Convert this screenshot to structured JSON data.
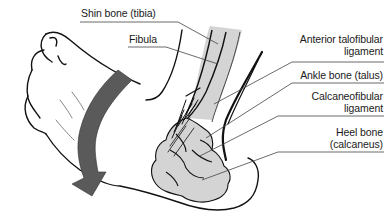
{
  "diagram": {
    "colors": {
      "bone_fill": "#d4d4d4",
      "outline": "#111111",
      "arrow_fill": "#5a5a5a",
      "leader_line": "#444444",
      "background": "#ffffff"
    },
    "labels": [
      {
        "id": "tibia",
        "lines": [
          "Shin bone (tibia)"
        ],
        "align": "left"
      },
      {
        "id": "fibula",
        "lines": [
          "Fibula"
        ],
        "align": "left"
      },
      {
        "id": "atfl",
        "lines": [
          "Anterior talofibular",
          "ligament"
        ],
        "align": "right"
      },
      {
        "id": "talus",
        "lines": [
          "Ankle bone (talus)"
        ],
        "align": "right"
      },
      {
        "id": "cfl",
        "lines": [
          "Calcaneofibular",
          "ligament"
        ],
        "align": "right"
      },
      {
        "id": "calcaneus",
        "lines": [
          "Heel bone",
          "(calcaneus)"
        ],
        "align": "right"
      }
    ],
    "arrow": {
      "meaning": "inversion-rotation-arrow",
      "direction": "downward-curved"
    }
  }
}
